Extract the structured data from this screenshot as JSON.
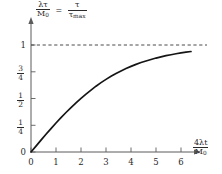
{
  "chart_data": {
    "type": "line",
    "title": "",
    "subtitle": "",
    "xlabel_parts": {
      "num_coef": "4",
      "num_lambda": "λ",
      "num_var": "t",
      "den_sym": "M",
      "den_sub": "0"
    },
    "ylabel_parts": {
      "left_num_lambda": "λ",
      "left_num_tau": "τ",
      "left_den_sym": "M",
      "left_den_sub": "0",
      "equals": "=",
      "right_num_tau": "τ",
      "right_den_tau": "τ",
      "right_den_sub": "max"
    },
    "xlabel_text": "4λt / M0",
    "ylabel_text": "λτ / M0 = τ / τmax",
    "xticks": [
      0,
      1,
      2,
      3,
      4,
      5,
      6
    ],
    "xticklabels": [
      "0",
      "1",
      "2",
      "3",
      "4",
      "5",
      "6"
    ],
    "yticks": [
      0,
      0.25,
      0.5,
      0.75,
      1
    ],
    "yticklabels": [
      "0",
      "1/4",
      "1/2",
      "3/4",
      "1"
    ],
    "ytick_fracs": [
      {
        "num": "",
        "den": "",
        "plain": "0"
      },
      {
        "num": "1",
        "den": "4",
        "plain": ""
      },
      {
        "num": "1",
        "den": "2",
        "plain": ""
      },
      {
        "num": "3",
        "den": "4",
        "plain": ""
      },
      {
        "num": "",
        "den": "",
        "plain": "1"
      }
    ],
    "xlim": [
      0,
      6.6
    ],
    "ylim": [
      0,
      1.12
    ],
    "grid": false,
    "legend": false,
    "annotations": [
      {
        "name": "asymptote",
        "type": "hline",
        "y": 1,
        "style": "dashed",
        "label": ""
      }
    ],
    "series": [
      {
        "name": "tau over tau_max",
        "style": "solid",
        "color": "#151515",
        "x": [
          0.0,
          0.2,
          0.4,
          0.6,
          0.8,
          1.0,
          1.2,
          1.4,
          1.6,
          1.8,
          2.0,
          2.2,
          2.4,
          2.6,
          2.8,
          3.0,
          3.2,
          3.4,
          3.6,
          3.8,
          4.0,
          4.2,
          4.4,
          4.6,
          4.8,
          5.0,
          5.2,
          5.4,
          5.6,
          5.8,
          6.0,
          6.2,
          6.4
        ],
        "y": [
          0.0,
          0.055,
          0.111,
          0.166,
          0.219,
          0.271,
          0.321,
          0.369,
          0.415,
          0.459,
          0.501,
          0.541,
          0.579,
          0.615,
          0.648,
          0.679,
          0.708,
          0.734,
          0.758,
          0.78,
          0.8,
          0.819,
          0.836,
          0.851,
          0.865,
          0.878,
          0.889,
          0.9,
          0.909,
          0.918,
          0.926,
          0.933,
          0.939
        ]
      }
    ]
  },
  "axes": {
    "x_arrow": true,
    "y_arrow": true,
    "origin_label": "0"
  }
}
